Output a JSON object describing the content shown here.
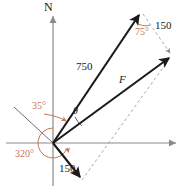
{
  "figure": {
    "type": "vector-diagram",
    "colors": {
      "vector": "#1a1a1a",
      "axis": "#8a8a8a",
      "angle": "#c9735a",
      "dashed": "#a8a8a8",
      "background": "#ffffff"
    },
    "axes": {
      "north_label": "N",
      "vertical_axis": "vertical-axis",
      "horizontal_axis": "horizontal-axis"
    },
    "labels": {
      "north": "N",
      "magnitude_750": "750",
      "magnitude_150_top": "150",
      "magnitude_150_bottom": "150",
      "resultant": "F",
      "angle_35": "35°",
      "angle_75": "75°",
      "angle_320": "320°",
      "angle_theta": "θ"
    },
    "vectors": [
      {
        "name": "vector-750",
        "label": "750",
        "magnitude": 750,
        "origin": [
          53,
          143
        ],
        "tip": [
          141,
          12
        ],
        "style": "solid-arrow"
      },
      {
        "name": "vector-F-resultant",
        "label": "F",
        "origin": [
          53,
          143
        ],
        "tip": [
          172,
          56
        ],
        "style": "solid-arrow"
      },
      {
        "name": "vector-150-bottom",
        "label": "150",
        "magnitude": 150,
        "origin": [
          53,
          143
        ],
        "tip": [
          82,
          180
        ],
        "style": "solid-arrow"
      },
      {
        "name": "vector-150-top-dashed",
        "label": "150",
        "magnitude": 150,
        "origin": [
          141,
          12
        ],
        "tip": [
          172,
          56
        ],
        "style": "dashed-arrow"
      }
    ],
    "dashed_lines": [
      {
        "name": "parallelogram-side",
        "from": [
          82,
          180
        ],
        "to": [
          172,
          56
        ]
      }
    ],
    "angles": [
      {
        "name": "angle-35",
        "label": "35°",
        "value": 35,
        "color": "#c9735a"
      },
      {
        "name": "angle-75",
        "label": "75°",
        "value": 75,
        "color": "#c9735a"
      },
      {
        "name": "angle-320",
        "label": "320°",
        "value": 320,
        "color": "#c9735a"
      },
      {
        "name": "angle-theta",
        "label": "θ",
        "color": "#1a1a1a"
      }
    ]
  }
}
